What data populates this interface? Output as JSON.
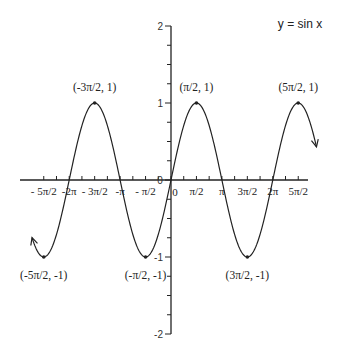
{
  "chart_data": {
    "type": "line",
    "title": "y = sin x",
    "xlabel": "",
    "ylabel": "",
    "function": "sin(x)",
    "xlim": [
      -8.6,
      9.1
    ],
    "ylim": [
      -2,
      2
    ],
    "grid": false,
    "legend": null,
    "x_ticks": [
      {
        "value": -7.854,
        "label": "- 5π/2"
      },
      {
        "value": -6.283,
        "label": "-2π"
      },
      {
        "value": -4.712,
        "label": "- 3π/2"
      },
      {
        "value": -3.1416,
        "label": "-π"
      },
      {
        "value": -1.5708,
        "label": "- π/2"
      },
      {
        "value": 0,
        "label": "0"
      },
      {
        "value": 1.5708,
        "label": "π/2"
      },
      {
        "value": 3.1416,
        "label": "π"
      },
      {
        "value": 4.712,
        "label": "3π/2"
      },
      {
        "value": 6.283,
        "label": "2π"
      },
      {
        "value": 7.854,
        "label": "5π/2"
      }
    ],
    "y_ticks": [
      {
        "value": 2,
        "label": "2"
      },
      {
        "value": 1,
        "label": "1"
      },
      {
        "value": 0,
        "label": "0"
      },
      {
        "value": -1,
        "label": "-1"
      },
      {
        "value": -2,
        "label": "-2"
      }
    ],
    "annotations": [
      {
        "x": -4.712,
        "y": 1,
        "label": "(-3π/2, 1)"
      },
      {
        "x": 1.5708,
        "y": 1,
        "label": "(π/2, 1)"
      },
      {
        "x": 7.854,
        "y": 1,
        "label": "(5π/2, 1)"
      },
      {
        "x": -7.854,
        "y": -1,
        "label": "(-5π/2, -1)"
      },
      {
        "x": -1.5708,
        "y": -1,
        "label": "(-π/2, -1)"
      },
      {
        "x": 4.712,
        "y": -1,
        "label": "(3π/2, -1)"
      }
    ],
    "arrows_at_ends": true
  }
}
